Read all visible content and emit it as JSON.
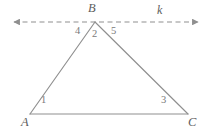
{
  "figure": {
    "kind": "geometry-diagram",
    "background_color": "#ffffff",
    "stroke_color": "#8f8f8f",
    "text_color": "#6e6e6e"
  },
  "vertices": {
    "A": {
      "label": "A",
      "x": 30,
      "y": 114
    },
    "B": {
      "label": "B",
      "x": 95,
      "y": 22
    },
    "C": {
      "label": "C",
      "x": 188,
      "y": 114
    }
  },
  "transversal_line": {
    "label": "k",
    "style": "dashed",
    "arrow_both_ends": true,
    "y": 22,
    "x_start": 10,
    "x_end": 202
  },
  "angles": [
    {
      "id": "1",
      "label": "1",
      "vertex": "A",
      "x": 44,
      "y": 99
    },
    {
      "id": "2",
      "label": "2",
      "vertex": "B",
      "x": 95,
      "y": 33
    },
    {
      "id": "3",
      "label": "3",
      "vertex": "C",
      "x": 164,
      "y": 99
    },
    {
      "id": "4",
      "label": "4",
      "vertex": "B",
      "x": 80,
      "y": 31
    },
    {
      "id": "5",
      "label": "5",
      "vertex": "B",
      "x": 114,
      "y": 31
    }
  ],
  "labels": {
    "vertex_a": "A",
    "vertex_b": "B",
    "vertex_c": "C",
    "line_k": "k",
    "angle_1": "1",
    "angle_2": "2",
    "angle_3": "3",
    "angle_4": "4",
    "angle_5": "5"
  }
}
